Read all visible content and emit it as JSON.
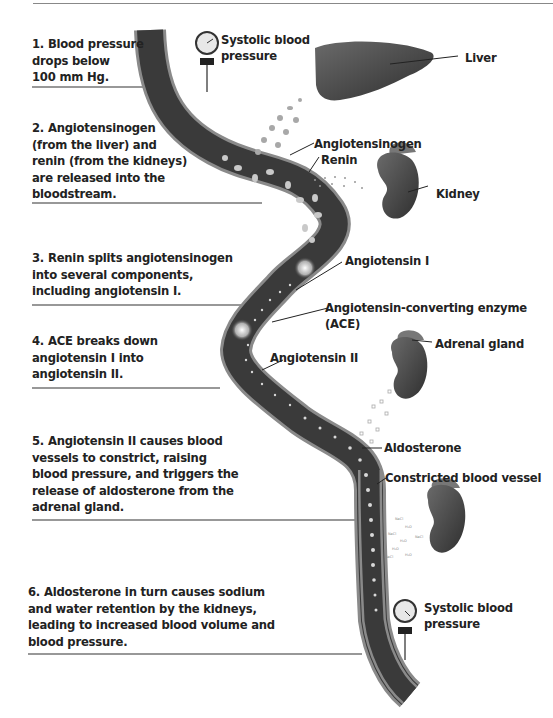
{
  "steps": [
    {
      "lines": [
        "1. Blood pressure",
        "drops below",
        "100 mm Hg."
      ]
    },
    {
      "lines": [
        "2. Angiotensinogen",
        "(from the liver) and",
        "renin (from the kidneys)",
        "are released into the",
        "bloodstream."
      ]
    },
    {
      "lines": [
        "3. Renin splits angiotensinogen",
        "into several components,",
        "including angiotensin I."
      ]
    },
    {
      "lines": [
        "4. ACE breaks down",
        "angiotensin I into",
        "angiotensin II."
      ]
    },
    {
      "lines": [
        "5. Angiotensin II causes blood",
        "vessels to constrict, raising",
        "blood pressure, and triggers the",
        "release of aldosterone from the",
        "adrenal gland."
      ]
    },
    {
      "lines": [
        "6. Aldosterone in turn causes sodium",
        "and water retention by the kidneys,",
        "leading to increased blood volume and",
        "blood pressure."
      ]
    }
  ],
  "labels": {
    "systolic_top": [
      "Systolic blood",
      "pressure"
    ],
    "liver": "Liver",
    "angiotensinogen": "Angiotensinogen",
    "renin": "Renin",
    "kidney": "Kidney",
    "angiotensin_1": "Angiotensin I",
    "ace": [
      "Angiotensin-converting enzyme",
      "(ACE)"
    ],
    "angiotensin_2": "Angiotensin II",
    "adrenal_gland": "Adrenal gland",
    "aldosterone": "Aldosterone",
    "constricted_vessel": "Constricted blood vessel",
    "systolic_bottom": [
      "Systolic blood",
      "pressure"
    ],
    "molecules": [
      "NaCl",
      "H₂O"
    ]
  },
  "colors": {
    "vessel_wall": "#8a8a8a",
    "vessel_lumen": "#3a3a3a",
    "organ": "#4a4a4a",
    "text": "#222222",
    "rule": "#333333"
  }
}
